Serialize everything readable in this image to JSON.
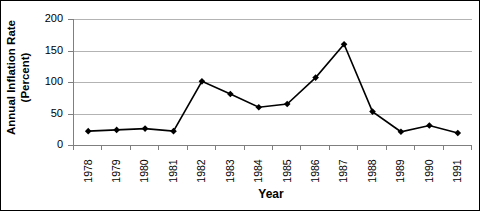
{
  "chart_data": {
    "type": "line",
    "title": "",
    "xlabel": "Year",
    "ylabel": "Annual Inflation Rate (Percent)",
    "ylabel_line1": "Annual Inflation Rate",
    "ylabel_line2": "(Percent)",
    "categories": [
      "1978",
      "1979",
      "1980",
      "1981",
      "1982",
      "1983",
      "1984",
      "1985",
      "1986",
      "1987",
      "1988",
      "1989",
      "1990",
      "1991"
    ],
    "values": [
      22,
      24,
      26,
      22,
      101,
      81,
      60,
      65,
      107,
      160,
      53,
      21,
      31,
      19
    ],
    "ylim": [
      0,
      200
    ],
    "yticks": [
      0,
      50,
      100,
      150,
      200
    ],
    "ytick_labels": [
      "0",
      "50",
      "100",
      "150",
      "200"
    ],
    "grid": true,
    "grid_axis": "y",
    "legend": "none",
    "marker": "diamond",
    "marker_color": "#000000",
    "line_color": "#000000",
    "gridline_color": "#b3b3b3",
    "axis_color": "#7f7f7f",
    "background": "#ffffff",
    "border_color": "#000000"
  }
}
